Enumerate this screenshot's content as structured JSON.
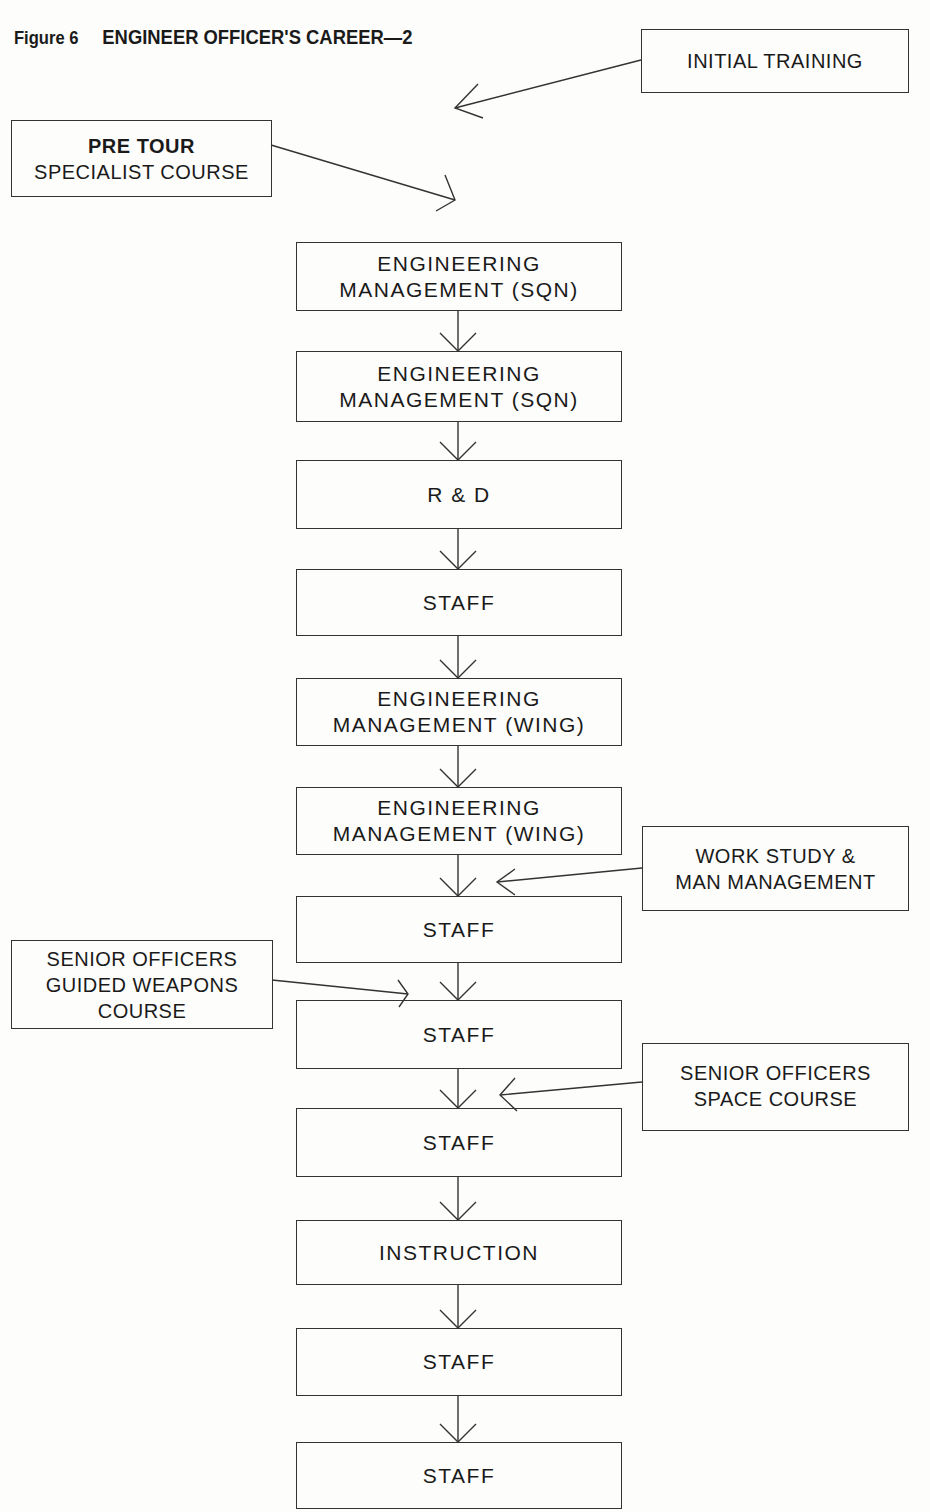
{
  "figure": {
    "label": "Figure 6",
    "title": "ENGINEER OFFICER'S CAREER—2"
  },
  "side_inputs": {
    "initial_training": [
      "INITIAL TRAINING"
    ],
    "pre_tour": {
      "bold": "PRE TOUR",
      "line2": "SPECIALIST COURSE"
    },
    "work_study": [
      "WORK STUDY &",
      "MAN MANAGEMENT"
    ],
    "guided_weapons": [
      "SENIOR OFFICERS",
      "GUIDED WEAPONS",
      "COURSE"
    ],
    "space_course": [
      "SENIOR OFFICERS",
      "SPACE COURSE"
    ]
  },
  "career_steps": [
    [
      "ENGINEERING",
      "MANAGEMENT (SQN)"
    ],
    [
      "ENGINEERING",
      "MANAGEMENT (SQN)"
    ],
    [
      "R & D"
    ],
    [
      "STAFF"
    ],
    [
      "ENGINEERING",
      "MANAGEMENT (WING)"
    ],
    [
      "ENGINEERING",
      "MANAGEMENT (WING)"
    ],
    [
      "STAFF"
    ],
    [
      "STAFF"
    ],
    [
      "STAFF"
    ],
    [
      "INSTRUCTION"
    ],
    [
      "STAFF"
    ],
    [
      "STAFF"
    ]
  ]
}
